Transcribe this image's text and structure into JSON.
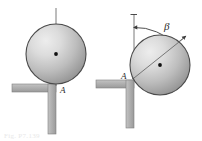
{
  "figure": {
    "type": "engineering-mechanics-diagram",
    "background_color": "#ffffff",
    "panels": [
      {
        "id": "left",
        "name": "upright-configuration",
        "sphere": {
          "cx": 56,
          "cy": 54,
          "r": 30,
          "outline_color": "#4a4a4a",
          "fill_light": "#e6e6e6",
          "fill_dark": "#8d8d8d",
          "highlight_cx": 40,
          "highlight_cy": 38
        },
        "center_dot": {
          "cx": 56,
          "cy": 54,
          "r": 1.8,
          "color": "#111111"
        },
        "axis_line": {
          "x1": 56,
          "y1": 8,
          "x2": 56,
          "y2": 86,
          "color": "#6b6b6b",
          "orientation": "vertical"
        },
        "contact_point": {
          "x": 56,
          "y": 84
        },
        "labels": [
          {
            "text": "A",
            "x": 60,
            "y": 92,
            "size": "label-a"
          }
        ],
        "support": {
          "color_face": "#b3b3b3",
          "color_edge": "#8a8a8a",
          "horizontal_arm": {
            "x": 12,
            "y": 84,
            "w": 44,
            "h": 8
          },
          "vertical_arm": {
            "x": 48,
            "y": 84,
            "w": 8,
            "h": 50
          }
        }
      },
      {
        "id": "right",
        "name": "rotated-configuration",
        "sphere": {
          "cx": 160,
          "cy": 65,
          "r": 30,
          "outline_color": "#4a4a4a",
          "fill_light": "#e6e6e6",
          "fill_dark": "#8d8d8d",
          "highlight_cx": 145,
          "highlight_cy": 49
        },
        "center_dot": {
          "cx": 160,
          "cy": 65,
          "r": 1.8,
          "color": "#111111"
        },
        "axis_line": {
          "x1": 134,
          "y1": 13,
          "x2": 134,
          "y2": 78,
          "color": "#6b6b6b",
          "orientation": "vertical-reference"
        },
        "tilted_line": {
          "x1": 131,
          "y1": 79,
          "x2": 185,
          "y2": 37,
          "color": "#6b6b6b",
          "orientation": "tilted-radius"
        },
        "angle_arc": {
          "center_x": 134,
          "center_y": 79,
          "radius": 52,
          "from_deg": 90,
          "to_deg": 38,
          "color": "#3a3a3a",
          "arrowheads": "both"
        },
        "contact_point": {
          "x": 133,
          "y": 78
        },
        "labels": [
          {
            "text": "A",
            "x": 123,
            "y": 76,
            "size": "label-a"
          },
          {
            "text": "β",
            "x": 166,
            "y": 26,
            "size": "label-beta"
          }
        ],
        "support": {
          "color_face": "#b3b3b3",
          "color_edge": "#8a8a8a",
          "horizontal_arm": {
            "x": 96,
            "y": 80,
            "w": 38,
            "h": 8
          },
          "vertical_arm": {
            "x": 126,
            "y": 80,
            "w": 8,
            "h": 48
          }
        }
      }
    ],
    "caption_fragment": "Fig. P7.139"
  }
}
